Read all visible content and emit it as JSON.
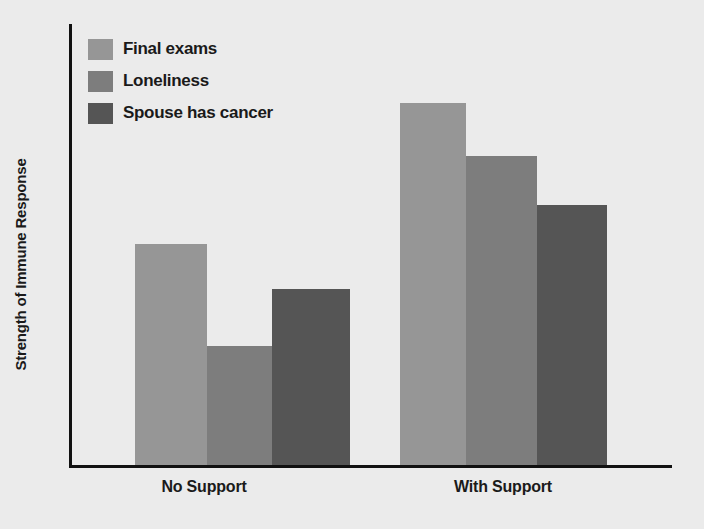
{
  "chart_data": {
    "type": "bar",
    "title": "",
    "xlabel": "",
    "ylabel": "Strength of Immune Response",
    "categories": [
      "No Support",
      "With Support"
    ],
    "series": [
      {
        "name": "Final exams",
        "color": "#969696",
        "values": [
          50,
          82
        ]
      },
      {
        "name": "Loneliness",
        "color": "#7d7d7d",
        "values": [
          27,
          70
        ]
      },
      {
        "name": "Spouse has cancer",
        "color": "#555555",
        "values": [
          40,
          59
        ]
      }
    ],
    "ylim": [
      0,
      100
    ],
    "grid": false,
    "legend_position": "top-left",
    "axis_color": "#111111",
    "background_color": "#ebebeb"
  },
  "legend": {
    "items": [
      {
        "label": "Final exams"
      },
      {
        "label": "Loneliness"
      },
      {
        "label": "Spouse has cancer"
      }
    ]
  },
  "axes": {
    "y_title": "Strength of Immune Response",
    "x_ticks": [
      {
        "label": "No Support"
      },
      {
        "label": "With Support"
      }
    ]
  }
}
